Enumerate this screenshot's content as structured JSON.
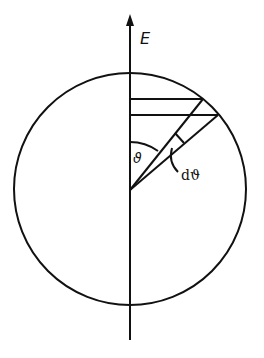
{
  "diagram": {
    "axis_label": "E",
    "angle_label": "ϑ",
    "differential_angle_label": "dϑ",
    "colors": {
      "stroke": "#111111",
      "background": "#ffffff"
    }
  }
}
